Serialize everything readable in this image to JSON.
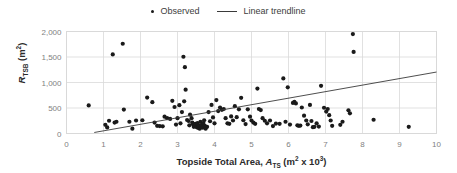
{
  "legend": {
    "position": "top-center",
    "entries": [
      {
        "label": "Observed",
        "marker": "dot-marker-icon",
        "color": "#1a1a1a"
      },
      {
        "label": "Linear trendline",
        "marker": "line-marker-icon",
        "color": "#3a3a3a"
      }
    ]
  },
  "axes": {
    "x_title_prefix": "Topside Total Area, ",
    "x_title_symbol": "A",
    "x_title_subscript": "TS",
    "x_title_units_pre": " (m",
    "x_title_units_sup1": "2",
    "x_title_units_mid": " x 10",
    "x_title_units_sup2": "3",
    "x_title_units_post": ")",
    "y_title_symbol": "R",
    "y_title_subscript": "TSB",
    "y_title_units_pre": " (m",
    "y_title_units_sup": "2",
    "y_title_units_post": ")"
  },
  "chart_data": {
    "type": "scatter",
    "title": "",
    "xlabel": "Topside Total Area, A_TS (m² x 10³)",
    "ylabel": "R_TSB (m²)",
    "xlim": [
      0,
      10
    ],
    "ylim": [
      0,
      2000
    ],
    "xticks": [
      0,
      1,
      2,
      3,
      4,
      5,
      6,
      7,
      8,
      9,
      10
    ],
    "xticklabels": [
      "0",
      "1",
      "2",
      "3",
      "4",
      "5",
      "6",
      "7",
      "8",
      "9",
      "10"
    ],
    "yticks": [
      0,
      500,
      1000,
      1500,
      2000
    ],
    "yticklabels": [
      "0",
      "500",
      "1,000",
      "1,500",
      "2,000"
    ],
    "grid": true,
    "grid_color": "#d9d9d9",
    "marker_color": "#1a1a1a",
    "marker_size": 2.1,
    "series": [
      {
        "name": "Observed",
        "type": "scatter",
        "points": [
          [
            0.6,
            550
          ],
          [
            1.05,
            170
          ],
          [
            1.1,
            120
          ],
          [
            1.15,
            250
          ],
          [
            1.25,
            1550
          ],
          [
            1.3,
            215
          ],
          [
            1.35,
            230
          ],
          [
            1.52,
            1760
          ],
          [
            1.55,
            470
          ],
          [
            1.7,
            230
          ],
          [
            1.78,
            95
          ],
          [
            1.88,
            255
          ],
          [
            2.05,
            260
          ],
          [
            2.18,
            705
          ],
          [
            2.32,
            615
          ],
          [
            2.38,
            215
          ],
          [
            2.45,
            150
          ],
          [
            2.52,
            145
          ],
          [
            2.6,
            140
          ],
          [
            2.65,
            330
          ],
          [
            2.72,
            300
          ],
          [
            2.8,
            285
          ],
          [
            2.86,
            640
          ],
          [
            2.92,
            520
          ],
          [
            2.96,
            175
          ],
          [
            3.0,
            300
          ],
          [
            3.05,
            555
          ],
          [
            3.08,
            200
          ],
          [
            3.12,
            420
          ],
          [
            3.16,
            1505
          ],
          [
            3.18,
            630
          ],
          [
            3.2,
            1300
          ],
          [
            3.22,
            860
          ],
          [
            3.26,
            265
          ],
          [
            3.3,
            245
          ],
          [
            3.32,
            160
          ],
          [
            3.34,
            370
          ],
          [
            3.38,
            300
          ],
          [
            3.4,
            215
          ],
          [
            3.42,
            180
          ],
          [
            3.44,
            130
          ],
          [
            3.46,
            145
          ],
          [
            3.48,
            190
          ],
          [
            3.5,
            160
          ],
          [
            3.52,
            125
          ],
          [
            3.54,
            205
          ],
          [
            3.55,
            175
          ],
          [
            3.56,
            110
          ],
          [
            3.58,
            150
          ],
          [
            3.6,
            95
          ],
          [
            3.62,
            230
          ],
          [
            3.64,
            135
          ],
          [
            3.66,
            175
          ],
          [
            3.68,
            115
          ],
          [
            3.7,
            205
          ],
          [
            3.72,
            260
          ],
          [
            3.74,
            150
          ],
          [
            3.76,
            95
          ],
          [
            3.8,
            130
          ],
          [
            3.84,
            420
          ],
          [
            3.88,
            240
          ],
          [
            3.92,
            560
          ],
          [
            3.96,
            315
          ],
          [
            4.0,
            200
          ],
          [
            4.05,
            655
          ],
          [
            4.1,
            440
          ],
          [
            4.15,
            510
          ],
          [
            4.2,
            465
          ],
          [
            4.25,
            480
          ],
          [
            4.3,
            300
          ],
          [
            4.35,
            200
          ],
          [
            4.4,
            190
          ],
          [
            4.45,
            335
          ],
          [
            4.5,
            255
          ],
          [
            4.55,
            535
          ],
          [
            4.6,
            320
          ],
          [
            4.66,
            475
          ],
          [
            4.72,
            700
          ],
          [
            4.78,
            260
          ],
          [
            4.84,
            185
          ],
          [
            4.9,
            475
          ],
          [
            4.96,
            330
          ],
          [
            5.0,
            255
          ],
          [
            5.05,
            215
          ],
          [
            5.1,
            190
          ],
          [
            5.16,
            880
          ],
          [
            5.2,
            480
          ],
          [
            5.25,
            460
          ],
          [
            5.3,
            300
          ],
          [
            5.36,
            250
          ],
          [
            5.42,
            200
          ],
          [
            5.5,
            255
          ],
          [
            5.58,
            145
          ],
          [
            5.66,
            195
          ],
          [
            5.76,
            190
          ],
          [
            5.86,
            1080
          ],
          [
            5.92,
            230
          ],
          [
            5.98,
            905
          ],
          [
            6.04,
            175
          ],
          [
            6.12,
            600
          ],
          [
            6.16,
            620
          ],
          [
            6.2,
            590
          ],
          [
            6.24,
            160
          ],
          [
            6.28,
            150
          ],
          [
            6.32,
            155
          ],
          [
            6.36,
            510
          ],
          [
            6.42,
            350
          ],
          [
            6.48,
            255
          ],
          [
            6.52,
            180
          ],
          [
            6.58,
            560
          ],
          [
            6.62,
            245
          ],
          [
            6.66,
            125
          ],
          [
            6.7,
            130
          ],
          [
            6.76,
            200
          ],
          [
            6.82,
            135
          ],
          [
            6.88,
            935
          ],
          [
            6.96,
            505
          ],
          [
            7.02,
            430
          ],
          [
            7.06,
            480
          ],
          [
            7.1,
            360
          ],
          [
            7.14,
            255
          ],
          [
            7.18,
            150
          ],
          [
            7.4,
            170
          ],
          [
            7.46,
            230
          ],
          [
            7.62,
            455
          ],
          [
            7.66,
            395
          ],
          [
            7.74,
            1950
          ],
          [
            7.76,
            1600
          ],
          [
            8.3,
            270
          ],
          [
            9.25,
            130
          ]
        ]
      },
      {
        "name": "Linear trendline",
        "type": "line",
        "color": "#3a3a3a",
        "x_start": 0.75,
        "y_start": 20,
        "x_end": 10.0,
        "y_end": 1205
      }
    ]
  }
}
